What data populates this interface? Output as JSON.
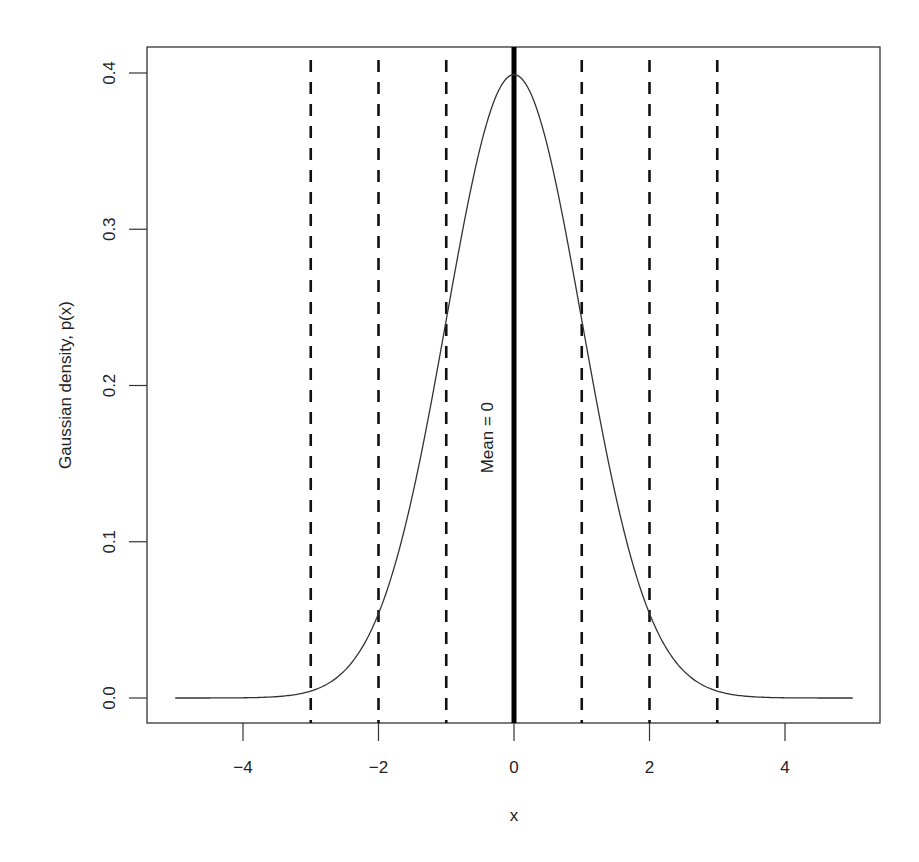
{
  "chart_data": {
    "type": "line",
    "title": "",
    "xlabel": "x",
    "ylabel": "Gaussian density, p(x)",
    "xlim": [
      -5,
      5
    ],
    "ylim": [
      0,
      0.4
    ],
    "x_ticks": [
      -4,
      -2,
      0,
      2,
      4
    ],
    "x_tick_labels": [
      "−4",
      "−2",
      "0",
      "2",
      "4"
    ],
    "y_ticks": [
      0.0,
      0.1,
      0.2,
      0.3,
      0.4
    ],
    "y_tick_labels": [
      "0.0",
      "0.1",
      "0.2",
      "0.3",
      "0.4"
    ],
    "grid": false,
    "legend": null,
    "series": [
      {
        "name": "Standard normal density",
        "function": "dnorm(x, mean=0, sd=1)",
        "x_range": [
          -5,
          5
        ],
        "sample_points": {
          "x": [
            -5,
            -4,
            -3,
            -2,
            -1,
            0,
            1,
            2,
            3,
            4,
            5
          ],
          "y": [
            1.5e-06,
            0.000134,
            0.00443,
            0.054,
            0.242,
            0.399,
            0.242,
            0.054,
            0.00443,
            0.000134,
            1.5e-06
          ]
        },
        "color": "#333333"
      }
    ],
    "vertical_lines": [
      {
        "x": -3,
        "style": "dashed",
        "color": "#111111"
      },
      {
        "x": -2,
        "style": "dashed",
        "color": "#111111"
      },
      {
        "x": -1,
        "style": "dashed",
        "color": "#111111"
      },
      {
        "x": 0,
        "style": "solid-thick",
        "color": "#000000"
      },
      {
        "x": 1,
        "style": "dashed",
        "color": "#111111"
      },
      {
        "x": 2,
        "style": "dashed",
        "color": "#111111"
      },
      {
        "x": 3,
        "style": "dashed",
        "color": "#111111"
      }
    ],
    "annotations": [
      {
        "text": "Mean = 0",
        "x": -0.4,
        "y": 0.15,
        "rotation": -90
      }
    ]
  },
  "layout": {
    "plot_left": 147,
    "plot_top": 47,
    "plot_right": 880,
    "plot_bottom": 723,
    "x0_px": 514,
    "x_unit_px": 67.75,
    "y0_px": 698,
    "y_unit_px": 1562.5
  }
}
